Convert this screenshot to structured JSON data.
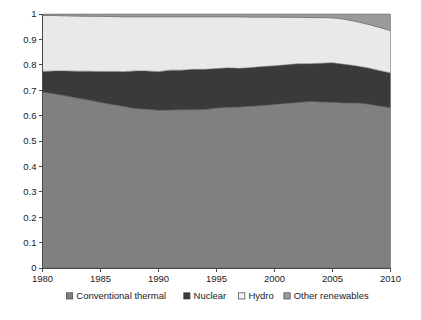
{
  "chart_data": {
    "type": "area",
    "stacked": true,
    "normalized": true,
    "title": "",
    "subtitle": "",
    "xlabel": "",
    "ylabel": "",
    "xlim": [
      1980,
      2010
    ],
    "ylim": [
      0,
      1
    ],
    "grid": false,
    "legend_position": "bottom",
    "x_ticks": [
      "1980",
      "1985",
      "1990",
      "1995",
      "2000",
      "2005",
      "2010"
    ],
    "x_tick_values": [
      1980,
      1985,
      1990,
      1995,
      2000,
      2005,
      2010
    ],
    "y_ticks": [
      "0",
      "0.1",
      "0.2",
      "0.3",
      "0.4",
      "0.5",
      "0.6",
      "0.7",
      "0.8",
      "0.9",
      "1"
    ],
    "y_tick_values": [
      0,
      0.1,
      0.2,
      0.3,
      0.4,
      0.5,
      0.6,
      0.7,
      0.8,
      0.9,
      1
    ],
    "x": [
      1980,
      1981,
      1982,
      1983,
      1984,
      1985,
      1986,
      1987,
      1988,
      1989,
      1990,
      1991,
      1992,
      1993,
      1994,
      1995,
      1996,
      1997,
      1998,
      1999,
      2000,
      2001,
      2002,
      2003,
      2004,
      2005,
      2006,
      2007,
      2008,
      2009,
      2010
    ],
    "series": [
      {
        "name": "Conventional thermal",
        "color": "#808080",
        "legend_marker": "square-filled-gray",
        "values": [
          0.693,
          0.686,
          0.678,
          0.669,
          0.661,
          0.652,
          0.644,
          0.636,
          0.628,
          0.625,
          0.621,
          0.622,
          0.623,
          0.623,
          0.624,
          0.63,
          0.632,
          0.634,
          0.637,
          0.64,
          0.644,
          0.648,
          0.652,
          0.656,
          0.654,
          0.652,
          0.65,
          0.65,
          0.646,
          0.638,
          0.632
        ]
      },
      {
        "name": "Nuclear",
        "color": "#3a3a3a",
        "legend_marker": "square-filled-dark",
        "values": [
          0.081,
          0.09,
          0.098,
          0.106,
          0.114,
          0.122,
          0.13,
          0.137,
          0.148,
          0.151,
          0.152,
          0.157,
          0.156,
          0.159,
          0.158,
          0.155,
          0.156,
          0.152,
          0.152,
          0.153,
          0.152,
          0.152,
          0.152,
          0.148,
          0.152,
          0.156,
          0.152,
          0.146,
          0.142,
          0.14,
          0.136
        ]
      },
      {
        "name": "Hydro",
        "color": "#e9e9e9",
        "legend_marker": "square-open",
        "values": [
          0.22,
          0.218,
          0.217,
          0.217,
          0.216,
          0.217,
          0.216,
          0.216,
          0.213,
          0.213,
          0.216,
          0.21,
          0.21,
          0.207,
          0.207,
          0.204,
          0.201,
          0.203,
          0.199,
          0.195,
          0.192,
          0.187,
          0.183,
          0.182,
          0.18,
          0.177,
          0.178,
          0.175,
          0.172,
          0.17,
          0.167
        ]
      },
      {
        "name": "Other renewables",
        "color": "#9a9a9a",
        "legend_marker": "square-filled-midgray",
        "values": [
          0.006,
          0.006,
          0.007,
          0.008,
          0.009,
          0.009,
          0.01,
          0.011,
          0.011,
          0.011,
          0.011,
          0.011,
          0.011,
          0.011,
          0.011,
          0.011,
          0.011,
          0.011,
          0.012,
          0.012,
          0.012,
          0.013,
          0.013,
          0.014,
          0.014,
          0.015,
          0.02,
          0.029,
          0.04,
          0.052,
          0.065
        ]
      }
    ]
  },
  "legend": {
    "items": [
      {
        "label": "Conventional thermal",
        "color": "#808080",
        "icon": "square-swatch-icon"
      },
      {
        "label": "Nuclear",
        "color": "#3a3a3a",
        "icon": "square-swatch-icon"
      },
      {
        "label": "Hydro",
        "color": "#f2f2f2",
        "icon": "square-swatch-icon"
      },
      {
        "label": "Other renewables",
        "color": "#9a9a9a",
        "icon": "square-swatch-icon"
      }
    ]
  },
  "axes": {
    "y_labels": [
      "1",
      "0.9",
      "0.8",
      "0.7",
      "0.6",
      "0.5",
      "0.4",
      "0.3",
      "0.2",
      "0.1",
      "0"
    ],
    "x_labels": [
      "1980",
      "1985",
      "1990",
      "1995",
      "2000",
      "2005",
      "2010"
    ]
  }
}
